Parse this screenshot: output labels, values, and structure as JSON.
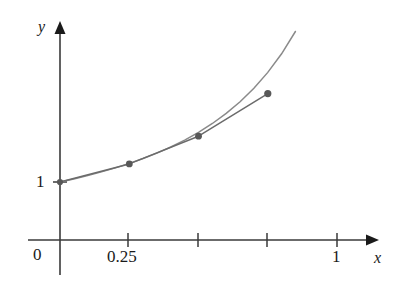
{
  "figure": {
    "title": "",
    "background_color": "#ffffff",
    "axis_color": "#3a3a3a",
    "curve_color": "#8a8a8a",
    "polyline_color": "#6b6b6b",
    "point_color": "#585858",
    "text_color": "#1a1a1a"
  },
  "axes": {
    "x_label": "x",
    "y_label": "y",
    "origin_label": "0",
    "x_tick_labels": [
      "0.25",
      "1"
    ],
    "y_tick_labels": [
      "1"
    ],
    "x_ticks_values": [
      0,
      0.25,
      0.5,
      0.75,
      1
    ],
    "x_ticks_px": [
      60,
      128,
      198,
      267,
      337
    ],
    "x_axis_y_px": 240,
    "y_axis_x_px": 60,
    "y_one_px": 182,
    "x_arrow_tip_px": 376,
    "y_arrow_tip_px": 22
  },
  "chart_data": {
    "type": "line",
    "title": "",
    "xlabel": "x",
    "ylabel": "y",
    "xlim": [
      0,
      1.12
    ],
    "ylim": [
      0,
      3.2
    ],
    "grid": false,
    "legend": "none",
    "x_tick_values": [
      0,
      0.25,
      0.5,
      0.75,
      1
    ],
    "x_tick_labels": [
      "0",
      "0.25",
      "",
      "",
      "1"
    ],
    "y_tick_values": [
      1
    ],
    "y_tick_labels": [
      "1"
    ],
    "series": [
      {
        "name": "exact-solution-curve",
        "type": "line",
        "style": "smooth",
        "color": "#8a8a8a",
        "x": [
          0,
          0.05,
          0.1,
          0.15,
          0.2,
          0.25,
          0.3,
          0.35,
          0.4,
          0.45,
          0.5,
          0.55,
          0.6,
          0.65,
          0.7,
          0.75,
          0.8,
          0.85,
          0.9,
          0.95,
          1,
          1.05,
          1.1
        ],
        "y": [
          1,
          1.053,
          1.111,
          1.174,
          1.243,
          1.32,
          1.405,
          1.499,
          1.604,
          1.723,
          1.857,
          2.009,
          2.183,
          2.384,
          2.617,
          2.889,
          3.211,
          3.594,
          4.056,
          4.62,
          5.318,
          6.196,
          7.321
        ]
      },
      {
        "name": "euler-polyline-approximation",
        "type": "line",
        "style": "piecewise-linear",
        "color": "#6b6b6b",
        "x": [
          0,
          0.25,
          0.5,
          0.75,
          1.1
        ],
        "y": [
          1,
          1.3125,
          1.79,
          2.525,
          4.11
        ]
      }
    ],
    "points": [
      {
        "name": "point-0",
        "x": 0,
        "y": 1,
        "px": [
          60,
          182
        ]
      },
      {
        "name": "point-1",
        "x": 0.25,
        "y": 1.3125,
        "px": [
          128,
          165
        ]
      },
      {
        "name": "point-2",
        "x": 0.5,
        "y": 1.79,
        "px": [
          197,
          144
        ]
      },
      {
        "name": "point-3",
        "x": 0.75,
        "y": 2.525,
        "px": [
          266,
          113
        ]
      }
    ],
    "annotations": []
  }
}
